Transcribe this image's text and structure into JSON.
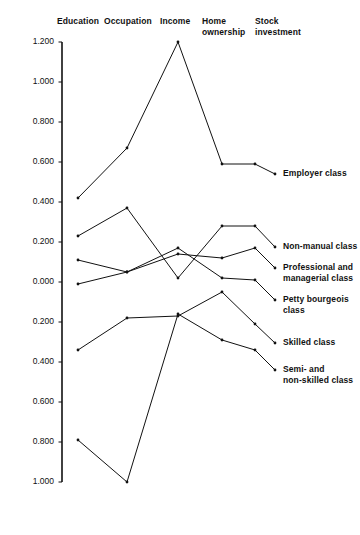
{
  "chart_data": {
    "type": "line",
    "subtype": "parallel-coordinates",
    "title": "",
    "xlabel": "",
    "ylabel": "",
    "ylim": [
      -1.0,
      1.2
    ],
    "grid": false,
    "legend_position": "right-inline",
    "axes": [
      {
        "key": "education",
        "label": "Education"
      },
      {
        "key": "occupation",
        "label": "Occupation"
      },
      {
        "key": "income",
        "label": "Income"
      },
      {
        "key": "home_ownership",
        "label": "Home\nownership"
      },
      {
        "key": "stock_investment",
        "label": "Stock\ninvestment"
      }
    ],
    "categories": [
      "Education",
      "Occupation",
      "Income",
      "Home ownership",
      "Stock investment"
    ],
    "yticks": [
      {
        "value": 1.2,
        "label": "1.200"
      },
      {
        "value": 1.0,
        "label": "1.000"
      },
      {
        "value": 0.8,
        "label": "0.800"
      },
      {
        "value": 0.6,
        "label": "0.600"
      },
      {
        "value": 0.4,
        "label": "0.400"
      },
      {
        "value": 0.2,
        "label": "0.200"
      },
      {
        "value": 0.0,
        "label": "0.000"
      },
      {
        "value": -0.2,
        "label": "0.200"
      },
      {
        "value": -0.4,
        "label": "0.400"
      },
      {
        "value": -0.6,
        "label": "0.600"
      },
      {
        "value": -0.8,
        "label": "0.800"
      },
      {
        "value": -1.0,
        "label": "1.000"
      }
    ],
    "series": [
      {
        "name": "Employer class",
        "label": "Employer class",
        "values": [
          0.42,
          0.67,
          1.2,
          0.59,
          0.59
        ]
      },
      {
        "name": "Non-manual class",
        "label": "Non-manual class",
        "values": [
          0.23,
          0.37,
          0.02,
          0.28,
          0.28
        ]
      },
      {
        "name": "Professional and managerial class",
        "label": "Professional and\nmanagerial class",
        "values": [
          0.11,
          0.05,
          0.14,
          0.12,
          0.17
        ]
      },
      {
        "name": "Petty bourgeois class",
        "label": "Petty bourgeois\nclass",
        "values": [
          -0.01,
          0.05,
          0.17,
          0.02,
          0.01
        ]
      },
      {
        "name": "Skilled class",
        "label": "Skilled class",
        "values": [
          -0.34,
          -0.18,
          -0.17,
          -0.05,
          -0.21
        ]
      },
      {
        "name": "Semi- and non-skilled class",
        "label": "Semi- and\nnon-skilled class",
        "values": [
          -0.79,
          -1.0,
          -0.16,
          -0.29,
          -0.34
        ]
      }
    ]
  }
}
